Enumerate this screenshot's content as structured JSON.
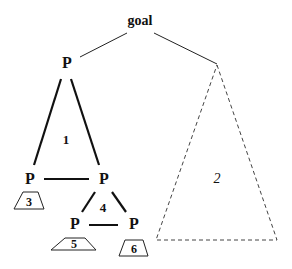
{
  "diagram": {
    "root": {
      "label": "goal"
    },
    "nodes": {
      "p_top": "P",
      "p_mid_left": "P",
      "p_mid_right": "P",
      "p_low_left": "P",
      "p_low_right": "P"
    },
    "regions": {
      "r1": "1",
      "r2": "2",
      "r3": "3",
      "r4": "4",
      "r5": "5",
      "r6": "6"
    }
  }
}
